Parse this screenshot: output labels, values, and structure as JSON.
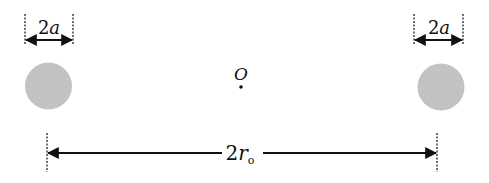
{
  "diagram": {
    "left_particle": {
      "label": "2a",
      "fill": "#c8c8c8"
    },
    "right_particle": {
      "label": "2a",
      "fill": "#c8c8c8"
    },
    "center": {
      "label": "O"
    },
    "separation": {
      "label_main": "2r",
      "label_sub": "o"
    },
    "colors": {
      "line": "#111111",
      "particle": "#c8c8c8",
      "background": "#ffffff"
    }
  }
}
